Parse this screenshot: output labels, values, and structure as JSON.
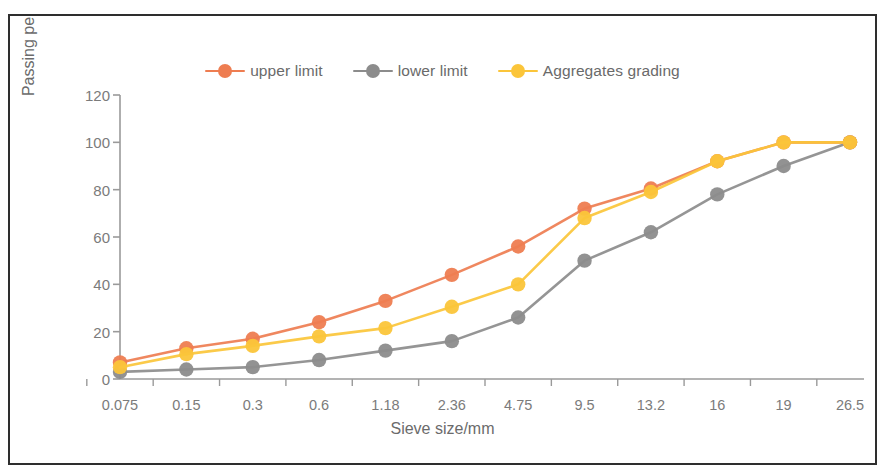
{
  "chart_data": {
    "type": "line",
    "title": "",
    "xlabel": "Sieve size/mm",
    "ylabel": "Passing percentage/%",
    "categories": [
      "0.075",
      "0.15",
      "0.3",
      "0.6",
      "1.18",
      "2.36",
      "4.75",
      "9.5",
      "13.2",
      "16",
      "19",
      "26.5"
    ],
    "yticks": [
      "0",
      "20",
      "40",
      "60",
      "80",
      "100",
      "120"
    ],
    "ylim": [
      0,
      120
    ],
    "grid": false,
    "legend_position": "top-center",
    "series": [
      {
        "name": "upper limit",
        "color": "#EE7D51",
        "marker": "circle",
        "values": [
          7,
          13,
          17,
          24,
          33,
          44,
          56,
          72,
          80.5,
          92,
          100,
          100
        ]
      },
      {
        "name": "lower limit",
        "color": "#8C8C8C",
        "marker": "circle",
        "values": [
          3,
          4,
          5,
          8,
          12,
          16,
          26,
          50,
          62,
          78,
          90,
          100
        ]
      },
      {
        "name": "Aggregates grading",
        "color": "#FBC53A",
        "marker": "circle",
        "values": [
          5,
          10.5,
          14,
          18,
          21.5,
          30.5,
          40,
          68,
          79,
          92,
          100,
          100
        ]
      }
    ]
  },
  "axis": {
    "y_title": "Passing percentage/%",
    "x_title": "Sieve size/mm"
  },
  "legend": {
    "items": [
      {
        "label": "upper limit",
        "color": "#EE7D51"
      },
      {
        "label": "lower limit",
        "color": "#8C8C8C"
      },
      {
        "label": "Aggregates grading",
        "color": "#FBC53A"
      }
    ]
  },
  "colors": {
    "upper_limit": "#EE7D51",
    "lower_limit": "#8C8C8C",
    "aggregates_grading": "#FBC53A",
    "axis": "#9a9a9a",
    "text": "#7b7b7b",
    "frame": "#2e2e2e"
  }
}
